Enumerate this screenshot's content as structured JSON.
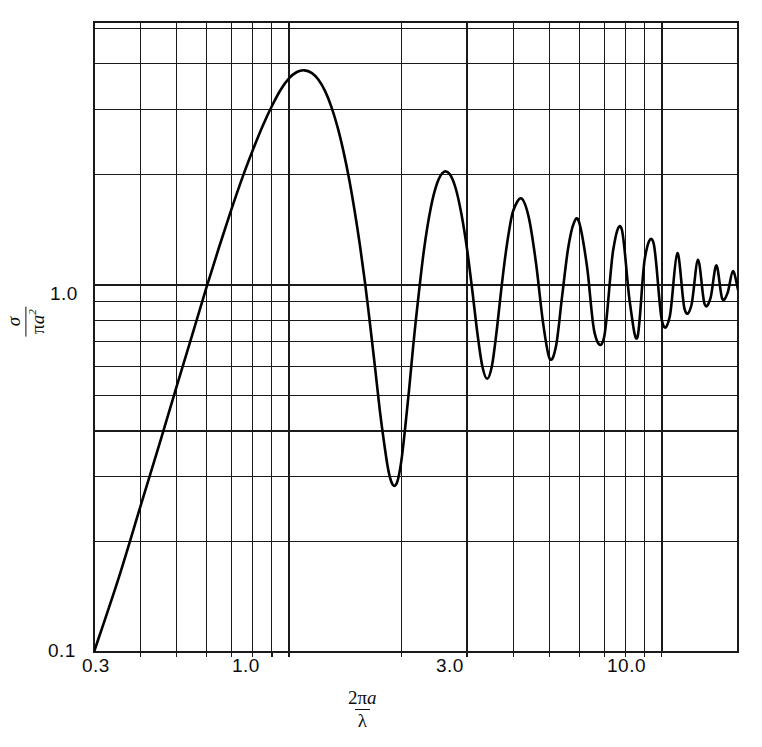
{
  "figure": {
    "background": "#ffffff",
    "ink": "#0d0d0d",
    "grid_color": "#1a1a1a",
    "curve_color": "#000000"
  },
  "axes": {
    "x_tick_labels": [
      "0.3",
      "1.0",
      "3.0",
      "10.0"
    ],
    "y_tick_labels": [
      "1.0",
      "0.1"
    ],
    "x_title": {
      "numerator_a": "2",
      "numerator_pi": "π",
      "numerator_var": "a",
      "denominator": "λ"
    },
    "y_title": {
      "numerator": "σ",
      "denominator_pi": "π",
      "denominator_var": "a",
      "denominator_exp": "2"
    }
  },
  "chart_data": {
    "type": "line",
    "title": "",
    "xlabel": "2πa/λ",
    "ylabel": "σ/πa²",
    "xscale": "log",
    "yscale": "log",
    "xlim": [
      0.3,
      16.0
    ],
    "ylim": [
      0.1,
      5.2
    ],
    "grid": true,
    "legend": null,
    "x_major_ticks": [
      1.0,
      3.0,
      10.0
    ],
    "x_minor_ticks": [
      0.4,
      0.5,
      0.6,
      0.7,
      0.8,
      0.9,
      2.0,
      4.0,
      5.0,
      6.0,
      7.0,
      8.0,
      9.0,
      20.0
    ],
    "y_major_ticks": [
      0.1,
      1.0
    ],
    "y_minor_ticks": [
      0.2,
      0.3,
      0.4,
      0.5,
      0.6,
      0.7,
      0.8,
      0.9,
      2.0,
      3.0,
      4.0,
      5.0
    ],
    "annotations": [],
    "series": [
      {
        "name": "scattering efficiency",
        "x": [
          0.3,
          0.35,
          0.4,
          0.45,
          0.5,
          0.55,
          0.6,
          0.65,
          0.7,
          0.75,
          0.8,
          0.85,
          0.9,
          0.95,
          1.0,
          1.05,
          1.1,
          1.15,
          1.2,
          1.25,
          1.3,
          1.35,
          1.4,
          1.45,
          1.5,
          1.55,
          1.6,
          1.65,
          1.7,
          1.75,
          1.8,
          1.85,
          1.9,
          1.95,
          2.0,
          2.05,
          2.1,
          2.15,
          2.2,
          2.3,
          2.4,
          2.5,
          2.6,
          2.7,
          2.8,
          2.9,
          3.0,
          3.1,
          3.2,
          3.3,
          3.4,
          3.5,
          3.6,
          3.7,
          3.8,
          3.9,
          4.0,
          4.2,
          4.4,
          4.6,
          4.8,
          5.0,
          5.2,
          5.4,
          5.6,
          5.8,
          6.0,
          6.3,
          6.6,
          7.0,
          7.4,
          7.8,
          8.2,
          8.6,
          9.0,
          9.5,
          10.0,
          10.5,
          11.0,
          11.5,
          12.0,
          12.5,
          13.0,
          13.5,
          14.0,
          14.5,
          15.0,
          15.5,
          16.0
        ],
        "y": [
          0.1,
          0.16,
          0.25,
          0.37,
          0.53,
          0.73,
          0.98,
          1.27,
          1.6,
          1.96,
          2.33,
          2.71,
          3.07,
          3.4,
          3.65,
          3.8,
          3.84,
          3.78,
          3.62,
          3.37,
          3.05,
          2.69,
          2.31,
          1.94,
          1.59,
          1.28,
          1.01,
          0.78,
          0.6,
          0.46,
          0.37,
          0.31,
          0.285,
          0.29,
          0.33,
          0.41,
          0.52,
          0.67,
          0.84,
          1.24,
          1.62,
          1.9,
          2.03,
          2.0,
          1.83,
          1.56,
          1.26,
          0.97,
          0.74,
          0.6,
          0.555,
          0.6,
          0.74,
          0.95,
          1.19,
          1.42,
          1.6,
          1.72,
          1.52,
          1.14,
          0.79,
          0.63,
          0.68,
          0.93,
          1.25,
          1.47,
          1.48,
          1.12,
          0.74,
          0.72,
          1.24,
          1.42,
          0.9,
          0.72,
          1.18,
          1.3,
          0.8,
          0.82,
          1.22,
          0.86,
          0.88,
          1.17,
          0.89,
          0.92,
          1.13,
          0.92,
          0.95,
          1.09,
          0.97
        ]
      }
    ]
  }
}
